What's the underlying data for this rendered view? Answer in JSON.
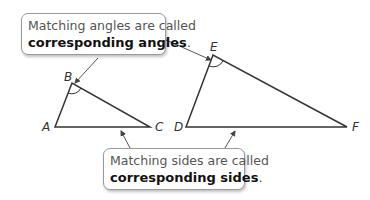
{
  "callouts": {
    "angles": {
      "line1": "Matching angles are called",
      "term": "corresponding angles",
      "end": "."
    },
    "sides": {
      "line1": "Matching sides are called",
      "term": "corresponding sides",
      "end": "."
    }
  },
  "triangles": {
    "small": {
      "vertices": [
        "A",
        "B",
        "C"
      ],
      "marked_angle": "B"
    },
    "large": {
      "vertices": [
        "D",
        "E",
        "F"
      ],
      "marked_angle": "E"
    }
  }
}
